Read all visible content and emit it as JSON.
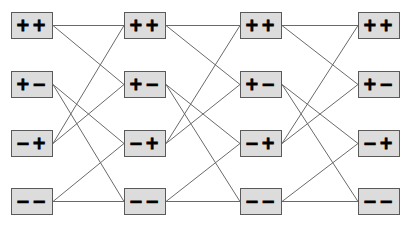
{
  "diagram": {
    "type": "layered-state-graph",
    "columns": 4,
    "rows": 4,
    "colors": {
      "node_fill": "#dcdcdc",
      "node_border": "#5a5a5a",
      "edge": "#6a6a6a",
      "label": "#000000"
    },
    "layers": [
      {
        "nodes": [
          {
            "id": "c0r0",
            "label": "++"
          },
          {
            "id": "c0r1",
            "label": "+−"
          },
          {
            "id": "c0r2",
            "label": "−+"
          },
          {
            "id": "c0r3",
            "label": "−−"
          }
        ]
      },
      {
        "nodes": [
          {
            "id": "c1r0",
            "label": "++"
          },
          {
            "id": "c1r1",
            "label": "+−"
          },
          {
            "id": "c1r2",
            "label": "−+"
          },
          {
            "id": "c1r3",
            "label": "−−"
          }
        ]
      },
      {
        "nodes": [
          {
            "id": "c2r0",
            "label": "++"
          },
          {
            "id": "c2r1",
            "label": "+−"
          },
          {
            "id": "c2r2",
            "label": "−+"
          },
          {
            "id": "c2r3",
            "label": "−−"
          }
        ]
      },
      {
        "nodes": [
          {
            "id": "c3r0",
            "label": "++"
          },
          {
            "id": "c3r1",
            "label": "+−"
          },
          {
            "id": "c3r2",
            "label": "−+"
          },
          {
            "id": "c3r3",
            "label": "−−"
          }
        ]
      }
    ],
    "transition_pattern": [
      {
        "from_row": 0,
        "to_rows": [
          0,
          1
        ]
      },
      {
        "from_row": 1,
        "to_rows": [
          2,
          3
        ]
      },
      {
        "from_row": 2,
        "to_rows": [
          0,
          1
        ]
      },
      {
        "from_row": 3,
        "to_rows": [
          2,
          3
        ]
      }
    ]
  }
}
